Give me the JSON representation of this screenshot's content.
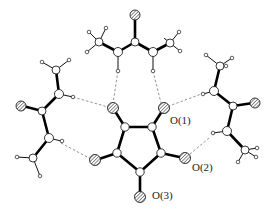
{
  "figure": {
    "type": "molecular-structure"
  },
  "labels": [
    {
      "id": "o1",
      "text": "O(1)",
      "x": 170,
      "y": 122
    },
    {
      "id": "o2",
      "text": "O(2)",
      "x": 192,
      "y": 170
    },
    {
      "id": "o3",
      "text": "O(3)",
      "x": 152,
      "y": 199
    }
  ],
  "atoms": {
    "ring_c": [
      [
        125,
        127
      ],
      [
        152,
        127
      ],
      [
        161,
        153
      ],
      [
        140,
        172
      ],
      [
        117,
        153
      ]
    ],
    "ring_o": [
      [
        113,
        108
      ],
      [
        164,
        108
      ],
      [
        184,
        158
      ],
      [
        140,
        196
      ],
      [
        96,
        160
      ]
    ]
  }
}
